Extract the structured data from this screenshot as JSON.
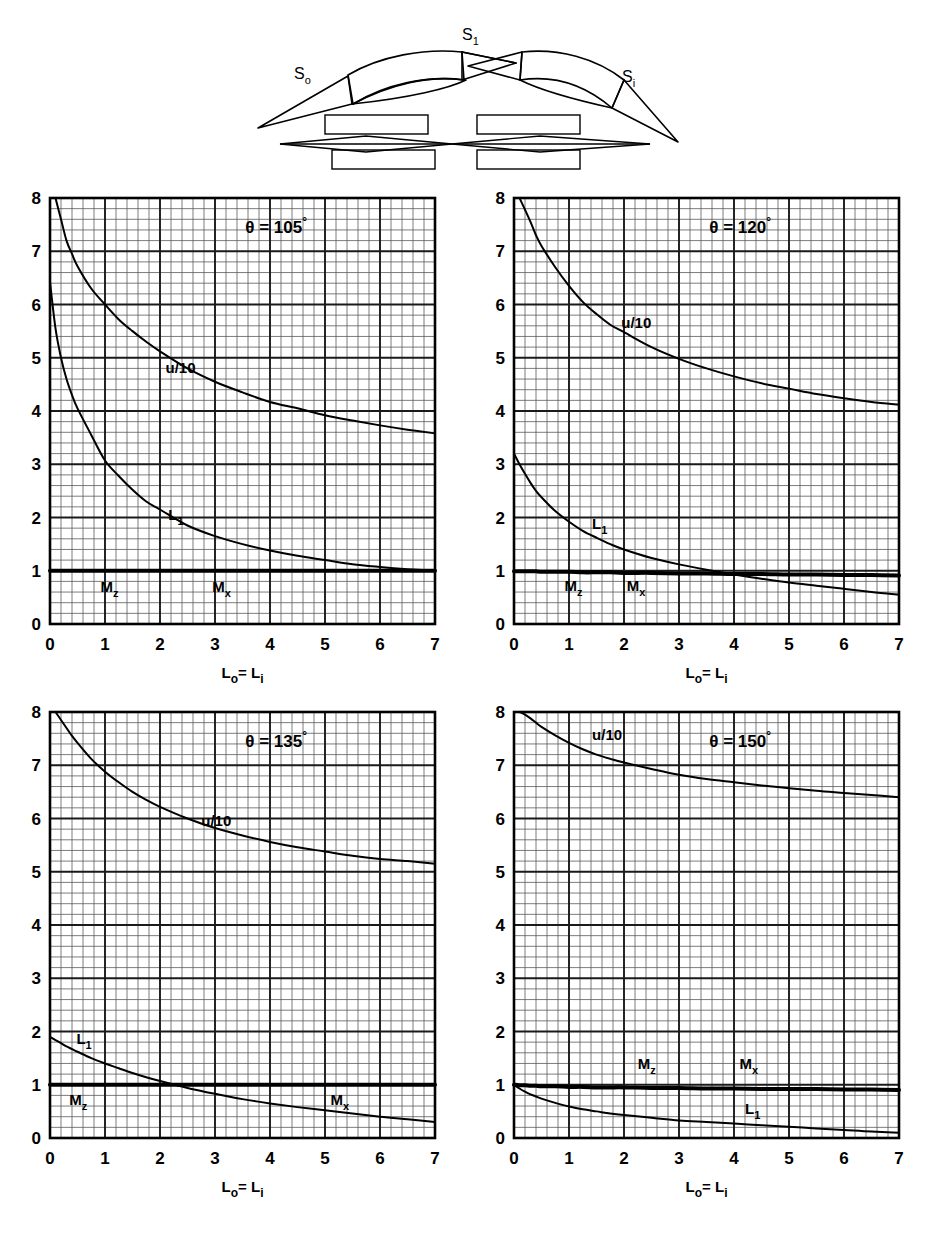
{
  "figure": {
    "background_color": "#ffffff",
    "ink_color": "#000000",
    "grid_minor_color": "#5a5a5a",
    "grid_major_color": "#1a1a1a"
  },
  "diagram": {
    "name": "cascade-blade-row-schematic",
    "labels": {
      "s_outer": "S",
      "s_outer_sub": "o",
      "s_center": "S",
      "s_center_sub": "1",
      "s_inner": "S",
      "s_inner_sub": "i"
    }
  },
  "axes": {
    "x_label_main": "L",
    "x_label_sub1": "o",
    "x_label_eq": "= L",
    "x_label_sub2": "i",
    "x_label_full": "Lo= Li",
    "x_ticks": [
      "0",
      "1",
      "2",
      "3",
      "4",
      "5",
      "6",
      "7"
    ],
    "y_ticks": [
      "0",
      "1",
      "2",
      "3",
      "4",
      "5",
      "6",
      "7",
      "8"
    ],
    "x_min": 0,
    "x_max": 7,
    "y_min": 0,
    "y_max": 8,
    "minor_divisions_per_unit": 5
  },
  "curve_labels": {
    "u_over_10": "u/10",
    "L_i": "L",
    "L_i_sub": "1",
    "M_z": "M",
    "M_z_sub": "z",
    "M_x": "M",
    "M_x_sub": "x"
  },
  "chart_data": [
    {
      "id": "theta-105",
      "type": "line",
      "title": "θ = 105°",
      "theta_symbol": "θ =",
      "theta_value": "105",
      "theta_degree": "°",
      "xlabel": "Lo= Li",
      "ylabel": "",
      "xlim": [
        0,
        7
      ],
      "ylim": [
        0,
        8
      ],
      "grid": true,
      "legend": "inline-annotations",
      "x": [
        0,
        0.1,
        0.2,
        0.3,
        0.4,
        0.5,
        0.75,
        1,
        1.25,
        1.5,
        1.75,
        2,
        2.5,
        3,
        3.5,
        4,
        4.5,
        5,
        5.5,
        6,
        6.5,
        7
      ],
      "series": [
        {
          "name": "u/10",
          "label": "u/10",
          "label_at": [
            2.1,
            4.72
          ],
          "values": [
            null,
            8.0,
            7.6,
            7.2,
            6.95,
            6.72,
            6.3,
            6.0,
            5.72,
            5.5,
            5.3,
            5.12,
            4.8,
            4.55,
            4.35,
            4.17,
            4.05,
            3.92,
            3.82,
            3.73,
            3.65,
            3.58
          ]
        },
        {
          "name": "L_i",
          "label": "L1",
          "label_at": [
            2.15,
            1.95
          ],
          "values": [
            6.42,
            5.55,
            5.0,
            4.6,
            4.3,
            4.05,
            3.55,
            3.07,
            2.78,
            2.52,
            2.3,
            2.15,
            1.85,
            1.65,
            1.5,
            1.38,
            1.28,
            1.2,
            1.12,
            1.07,
            1.03,
            1.0
          ]
        },
        {
          "name": "M_z and M_x",
          "label": "Mz / Mx",
          "label_at_mz": [
            0.92,
            0.6
          ],
          "label_at_mx": [
            2.95,
            0.6
          ],
          "constant": 1.0,
          "values": [
            1.0,
            1.0,
            1.0,
            1.0,
            1.0,
            1.0,
            1.0,
            1.0,
            1.0,
            1.0,
            1.0,
            1.0,
            1.0,
            1.0,
            1.0,
            1.0,
            1.0,
            1.0,
            1.0,
            1.0,
            1.0,
            1.0
          ]
        }
      ]
    },
    {
      "id": "theta-120",
      "type": "line",
      "title": "θ = 120°",
      "theta_symbol": "θ =",
      "theta_value": "120",
      "theta_degree": "°",
      "xlabel": "Lo= Li",
      "ylabel": "",
      "xlim": [
        0,
        7
      ],
      "ylim": [
        0,
        8
      ],
      "grid": true,
      "legend": "inline-annotations",
      "x": [
        0,
        0.1,
        0.2,
        0.3,
        0.4,
        0.5,
        0.75,
        1,
        1.25,
        1.5,
        1.75,
        2,
        2.5,
        3,
        3.5,
        4,
        4.5,
        5,
        5.5,
        6,
        6.5,
        7
      ],
      "series": [
        {
          "name": "u/10",
          "label": "u/10",
          "label_at": [
            1.95,
            5.55
          ],
          "values": [
            null,
            8.0,
            7.78,
            7.55,
            7.3,
            7.1,
            6.7,
            6.35,
            6.05,
            5.82,
            5.62,
            5.48,
            5.2,
            4.98,
            4.8,
            4.65,
            4.52,
            4.42,
            4.32,
            4.24,
            4.17,
            4.12
          ]
        },
        {
          "name": "L_i",
          "label": "L1",
          "label_at": [
            1.42,
            1.78
          ],
          "values": [
            3.2,
            3.0,
            2.82,
            2.65,
            2.5,
            2.38,
            2.12,
            1.92,
            1.75,
            1.62,
            1.5,
            1.4,
            1.24,
            1.12,
            1.02,
            0.93,
            0.85,
            0.78,
            0.72,
            0.66,
            0.6,
            0.55
          ]
        },
        {
          "name": "M_z and M_x",
          "label": "Mz / Mx",
          "label_at_mz": [
            0.92,
            0.62
          ],
          "label_at_mx": [
            2.05,
            0.62
          ],
          "constant": 0.97,
          "values": [
            0.99,
            0.99,
            0.99,
            0.99,
            0.99,
            0.98,
            0.98,
            0.98,
            0.97,
            0.97,
            0.97,
            0.96,
            0.96,
            0.95,
            0.95,
            0.94,
            0.94,
            0.93,
            0.93,
            0.92,
            0.92,
            0.91
          ]
        }
      ]
    },
    {
      "id": "theta-135",
      "type": "line",
      "title": "θ = 135°",
      "theta_symbol": "θ =",
      "theta_value": "135",
      "theta_degree": "°",
      "xlabel": "Lo= Li",
      "ylabel": "",
      "xlim": [
        0,
        7
      ],
      "ylim": [
        0,
        8
      ],
      "grid": true,
      "legend": "inline-annotations",
      "x": [
        0,
        0.1,
        0.2,
        0.3,
        0.4,
        0.5,
        0.75,
        1,
        1.25,
        1.5,
        1.75,
        2,
        2.5,
        3,
        3.5,
        4,
        4.5,
        5,
        5.5,
        6,
        6.5,
        7
      ],
      "series": [
        {
          "name": "u/10",
          "label": "u/10",
          "label_at": [
            2.75,
            5.85
          ],
          "values": [
            null,
            8.0,
            7.85,
            7.7,
            7.55,
            7.42,
            7.12,
            6.88,
            6.68,
            6.5,
            6.35,
            6.22,
            6.0,
            5.82,
            5.68,
            5.56,
            5.46,
            5.38,
            5.3,
            5.24,
            5.2,
            5.15
          ]
        },
        {
          "name": "L_i",
          "label": "L1",
          "label_at": [
            0.48,
            1.76
          ],
          "values": [
            1.9,
            1.84,
            1.78,
            1.72,
            1.67,
            1.62,
            1.5,
            1.4,
            1.31,
            1.22,
            1.14,
            1.07,
            0.94,
            0.83,
            0.73,
            0.65,
            0.58,
            0.52,
            0.46,
            0.4,
            0.35,
            0.3
          ]
        },
        {
          "name": "M_z and M_x",
          "label": "Mz / Mx",
          "label_at_mz": [
            0.35,
            0.62
          ],
          "label_at_mx": [
            5.1,
            0.62
          ],
          "constant": 1.0,
          "values": [
            1.0,
            1.0,
            1.0,
            1.0,
            1.0,
            1.0,
            1.0,
            1.0,
            1.0,
            1.0,
            1.0,
            1.0,
            1.0,
            1.0,
            1.0,
            1.0,
            1.0,
            1.0,
            1.0,
            1.0,
            1.0,
            1.0
          ]
        }
      ]
    },
    {
      "id": "theta-150",
      "type": "line",
      "title": "θ = 150°",
      "theta_symbol": "θ =",
      "theta_value": "150",
      "theta_degree": "°",
      "xlabel": "Lo= Li",
      "ylabel": "",
      "xlim": [
        0,
        7
      ],
      "ylim": [
        0,
        8
      ],
      "grid": true,
      "legend": "inline-annotations",
      "x": [
        0,
        0.1,
        0.2,
        0.3,
        0.4,
        0.5,
        0.75,
        1,
        1.25,
        1.5,
        1.75,
        2,
        2.5,
        3,
        3.5,
        4,
        4.5,
        5,
        5.5,
        6,
        6.5,
        7
      ],
      "series": [
        {
          "name": "u/10",
          "label": "u/10",
          "label_at": [
            1.42,
            7.48
          ],
          "values": [
            null,
            8.0,
            7.95,
            7.88,
            7.8,
            7.72,
            7.56,
            7.42,
            7.3,
            7.2,
            7.12,
            7.05,
            6.93,
            6.82,
            6.74,
            6.68,
            6.62,
            6.57,
            6.52,
            6.48,
            6.44,
            6.4
          ]
        },
        {
          "name": "L_i",
          "label": "L1",
          "label_at": [
            4.2,
            0.46
          ],
          "values": [
            1.0,
            0.93,
            0.87,
            0.82,
            0.78,
            0.74,
            0.66,
            0.59,
            0.54,
            0.5,
            0.46,
            0.43,
            0.38,
            0.33,
            0.3,
            0.27,
            0.24,
            0.21,
            0.18,
            0.15,
            0.12,
            0.1
          ]
        },
        {
          "name": "M_z and M_x",
          "label": "Mz / Mx",
          "label_at_mz": [
            2.25,
            1.3
          ],
          "label_at_mx": [
            4.1,
            1.3
          ],
          "constant": 0.95,
          "values": [
            1.0,
            0.99,
            0.99,
            0.98,
            0.98,
            0.97,
            0.97,
            0.96,
            0.96,
            0.95,
            0.95,
            0.95,
            0.94,
            0.94,
            0.93,
            0.93,
            0.92,
            0.92,
            0.92,
            0.91,
            0.91,
            0.9
          ]
        }
      ]
    }
  ]
}
